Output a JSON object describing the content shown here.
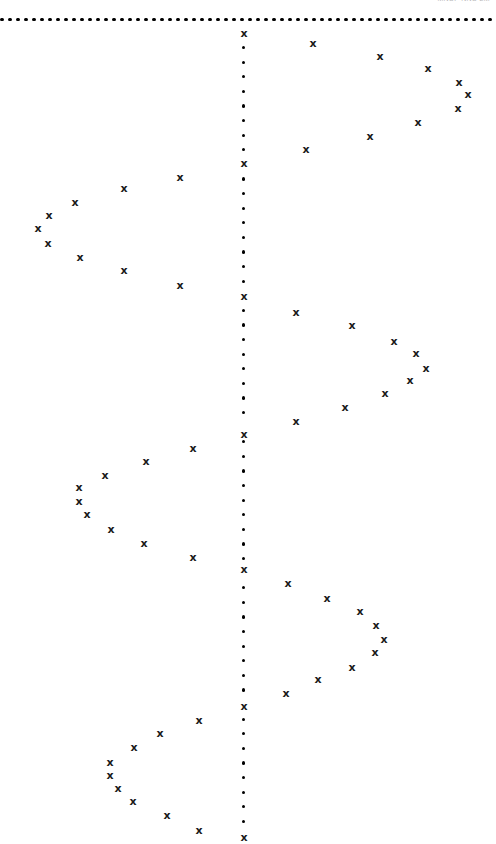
{
  "header": {
    "text": "MNSF NNS  2M"
  },
  "chart_data": {
    "type": "scatter",
    "title": "",
    "subtitle": "",
    "xlabel": "",
    "ylabel": "",
    "xlim": [
      0,
      496
    ],
    "ylim": [
      0,
      844
    ],
    "grid": false,
    "legend": null,
    "marker_symbol": "x",
    "marker_color": "#1a1a1a",
    "axis_color": "#000000",
    "axes": {
      "horizontal_axis": {
        "name": "top-dotted-boundary",
        "y": 20,
        "x_start": 2,
        "x_end": 494,
        "dot_spacing": 8.0,
        "style": "dotted"
      },
      "vertical_axis": {
        "name": "center-dotted-axis",
        "x": 244,
        "y_start": 33,
        "y_end": 840,
        "dot_spacing": 14.6,
        "style": "dotted"
      }
    },
    "axis_markers": {
      "name": "nodes-on-vertical-axis",
      "x": 244,
      "y": [
        33,
        163,
        296,
        434,
        569,
        706,
        837
      ]
    },
    "series": [
      {
        "name": "lobe-1-right",
        "points": [
          [
            313,
            43
          ],
          [
            380,
            56
          ],
          [
            428,
            68
          ],
          [
            459,
            82
          ],
          [
            468,
            94
          ],
          [
            458,
            108
          ],
          [
            418,
            122
          ],
          [
            370,
            136
          ],
          [
            306,
            149
          ]
        ]
      },
      {
        "name": "lobe-2-left",
        "points": [
          [
            180,
            177
          ],
          [
            124,
            188
          ],
          [
            75,
            202
          ],
          [
            49,
            215
          ],
          [
            38,
            228
          ],
          [
            48,
            243
          ],
          [
            80,
            257
          ],
          [
            124,
            270
          ],
          [
            180,
            285
          ]
        ]
      },
      {
        "name": "lobe-3-right",
        "points": [
          [
            296,
            312
          ],
          [
            352,
            325
          ],
          [
            394,
            341
          ],
          [
            416,
            353
          ],
          [
            426,
            368
          ],
          [
            410,
            380
          ],
          [
            385,
            393
          ],
          [
            345,
            407
          ],
          [
            296,
            421
          ]
        ]
      },
      {
        "name": "lobe-4-left",
        "points": [
          [
            193,
            448
          ],
          [
            146,
            461
          ],
          [
            105,
            475
          ],
          [
            79,
            487
          ],
          [
            79,
            501
          ],
          [
            87,
            514
          ],
          [
            111,
            529
          ],
          [
            144,
            543
          ],
          [
            193,
            557
          ]
        ]
      },
      {
        "name": "lobe-5-right",
        "points": [
          [
            288,
            583
          ],
          [
            327,
            598
          ],
          [
            360,
            611
          ],
          [
            376,
            625
          ],
          [
            384,
            639
          ],
          [
            375,
            652
          ],
          [
            352,
            667
          ],
          [
            318,
            679
          ],
          [
            286,
            693
          ]
        ]
      },
      {
        "name": "lobe-6-left",
        "points": [
          [
            199,
            720
          ],
          [
            160,
            733
          ],
          [
            134,
            747
          ],
          [
            110,
            762
          ],
          [
            110,
            775
          ],
          [
            118,
            788
          ],
          [
            133,
            801
          ],
          [
            167,
            815
          ],
          [
            199,
            830
          ]
        ]
      }
    ]
  }
}
